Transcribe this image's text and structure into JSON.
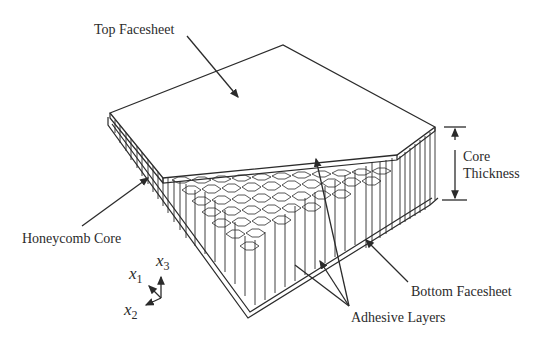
{
  "figure": {
    "labels": {
      "top_facesheet": "Top Facesheet",
      "core_thickness_line1": "Core",
      "core_thickness_line2": "Thickness",
      "honeycomb_core": "Honeycomb Core",
      "bottom_facesheet": "Bottom Facesheet",
      "adhesive_layers": "Adhesive Layers"
    },
    "axes": {
      "x1": "x",
      "x1_sub": "1",
      "x2": "x",
      "x2_sub": "2",
      "x3": "x",
      "x3_sub": "3"
    },
    "colors": {
      "line": "#2b2b2b",
      "background": "#ffffff"
    }
  }
}
